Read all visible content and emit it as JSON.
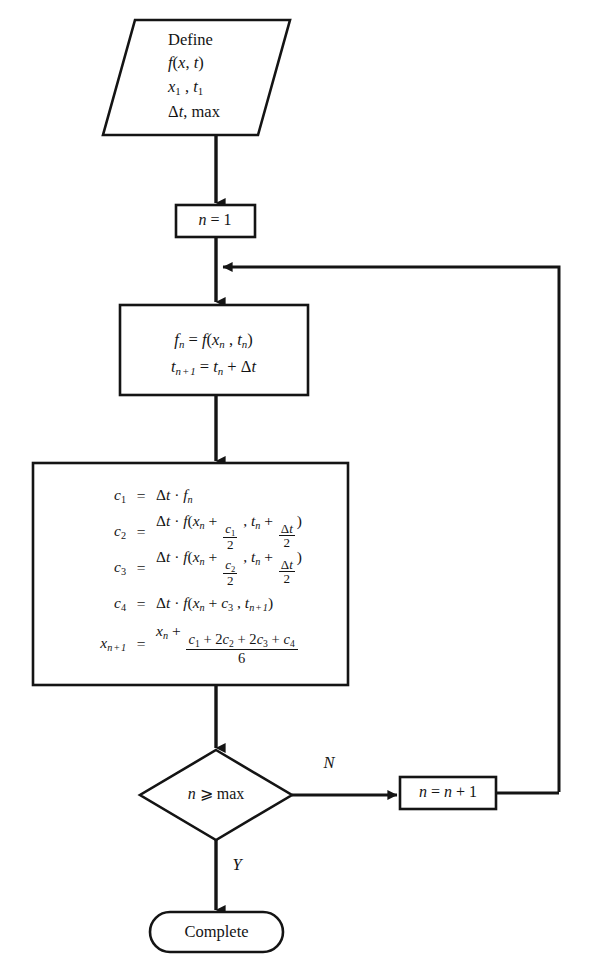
{
  "diagram": {
    "stroke_color": "#141414",
    "background_color": "#ffffff",
    "nodes": {
      "define": {
        "shape": "parallelogram",
        "lines": [
          "Define",
          "f(x, t)",
          "x1 , t1",
          "Δt, max"
        ]
      },
      "init": {
        "shape": "rectangle",
        "text": "n = 1"
      },
      "step": {
        "shape": "rectangle",
        "lines": [
          "fn = f(xn , tn)",
          "tn+1 = tn + Δt"
        ]
      },
      "rk4": {
        "shape": "rectangle",
        "equations": [
          {
            "lhs": "c1",
            "op": "=",
            "rhs": "Δt · fn"
          },
          {
            "lhs": "c2",
            "op": "=",
            "rhs": "Δt · f(xn + c1/2 , tn + Δt/2)"
          },
          {
            "lhs": "c3",
            "op": "=",
            "rhs": "Δt · f(xn + c2/2 , tn + Δt/2)"
          },
          {
            "lhs": "c4",
            "op": "=",
            "rhs": "Δt · f(xn + c3 , tn+1)"
          },
          {
            "lhs": "xn+1",
            "op": "=",
            "rhs": "xn + (c1 + 2c2 + 2c3 + c4)/6"
          }
        ]
      },
      "decision": {
        "shape": "diamond",
        "text": "n ⩾ max"
      },
      "increment": {
        "shape": "rectangle",
        "text": "n = n + 1"
      },
      "terminal": {
        "shape": "stadium",
        "text": "Complete"
      }
    },
    "edge_labels": {
      "no": "N",
      "yes": "Y"
    }
  }
}
